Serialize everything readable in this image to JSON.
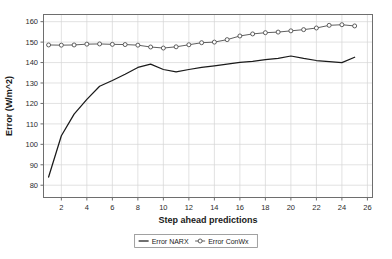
{
  "chart_data": {
    "type": "line",
    "title": "",
    "xlabel": "Step ahead predictions",
    "ylabel": "Error (W/m^2)",
    "xlim": [
      0.6,
      26.4
    ],
    "ylim": [
      74,
      163.5
    ],
    "xticks": [
      2,
      4,
      6,
      8,
      10,
      12,
      14,
      16,
      18,
      20,
      22,
      24,
      26
    ],
    "yticks": [
      80,
      90,
      100,
      110,
      120,
      130,
      140,
      150,
      160
    ],
    "grid": true,
    "legend_position": "bottom-center",
    "x": [
      1,
      2,
      3,
      4,
      5,
      6,
      7,
      8,
      9,
      10,
      11,
      12,
      13,
      14,
      15,
      16,
      17,
      18,
      19,
      20,
      21,
      22,
      23,
      24,
      25
    ],
    "series": [
      {
        "name": "Error NARX",
        "marker": "none",
        "color": "#1a1a1a",
        "values": [
          84.0,
          104.2,
          114.8,
          122.0,
          128.4,
          131.2,
          134.3,
          137.6,
          139.2,
          136.6,
          135.4,
          136.6,
          137.6,
          138.4,
          139.2,
          140.1,
          140.6,
          141.4,
          142.0,
          143.2,
          142.0,
          141.0,
          140.5,
          140.0,
          142.6
        ]
      },
      {
        "name": "Error ConWx",
        "marker": "circle",
        "color": "#4d4d4d",
        "values": [
          148.6,
          148.5,
          148.6,
          149.0,
          149.1,
          148.9,
          148.8,
          148.5,
          147.6,
          147.1,
          147.7,
          148.7,
          149.7,
          150.0,
          151.2,
          153.0,
          154.0,
          154.6,
          154.9,
          155.5,
          156.1,
          156.9,
          158.2,
          158.5,
          157.9
        ]
      }
    ]
  },
  "legend": {
    "items": [
      {
        "label": "Error NARX",
        "marker": "line"
      },
      {
        "label": "Error ConWx",
        "marker": "circle-line"
      }
    ]
  }
}
